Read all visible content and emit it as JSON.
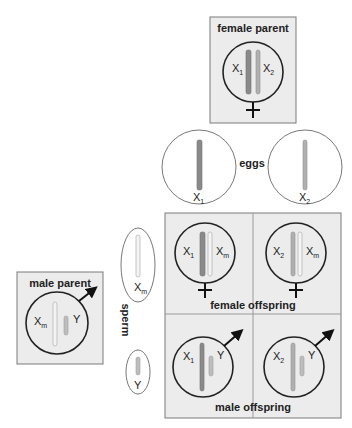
{
  "female_parent": {
    "title": "female parent",
    "chromosomes": [
      {
        "label": "X",
        "sub": "1"
      },
      {
        "label": "X",
        "sub": "2"
      }
    ],
    "symbol": "female-symbol"
  },
  "eggs": {
    "label": "eggs",
    "items": [
      {
        "label": "X",
        "sub": "1"
      },
      {
        "label": "X",
        "sub": "2"
      }
    ]
  },
  "male_parent": {
    "title": "male parent",
    "chromosomes": [
      {
        "label": "X",
        "sub": "m"
      },
      {
        "label": "Y",
        "sub": ""
      }
    ],
    "symbol": "male-symbol"
  },
  "sperm": {
    "label": "sperm",
    "items": [
      {
        "label": "X",
        "sub": "m"
      },
      {
        "label": "Y",
        "sub": ""
      }
    ]
  },
  "punnett": {
    "female_offspring_label": "female offspring",
    "male_offspring_label": "male offspring",
    "cells": [
      {
        "row": "female",
        "left": {
          "label": "X",
          "sub": "1"
        },
        "right": {
          "label": "X",
          "sub": "m"
        }
      },
      {
        "row": "female",
        "left": {
          "label": "X",
          "sub": "2"
        },
        "right": {
          "label": "X",
          "sub": "m"
        }
      },
      {
        "row": "male",
        "left": {
          "label": "X",
          "sub": "1"
        },
        "right": {
          "label": "Y",
          "sub": ""
        }
      },
      {
        "row": "male",
        "left": {
          "label": "X",
          "sub": "2"
        },
        "right": {
          "label": "Y",
          "sub": ""
        }
      }
    ]
  },
  "colors": {
    "X1": "#8a8a8a",
    "X2": "#b0b0b0",
    "Xm": "#f4f4f4",
    "Y": "#bdbdbd",
    "panel": "#ececec"
  }
}
